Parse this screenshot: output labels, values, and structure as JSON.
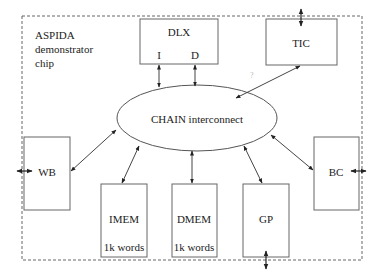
{
  "diagram": {
    "chip_label": [
      "ASPIDA",
      "demonstrator",
      "chip"
    ],
    "interconnect": {
      "label": "CHAIN interconnect"
    },
    "blocks": {
      "dlx": {
        "label": "DLX",
        "ports": {
          "instruction": "I",
          "data": "D"
        }
      },
      "tic": {
        "label": "TIC"
      },
      "wb": {
        "label": "WB"
      },
      "bc": {
        "label": "BC"
      },
      "imem": {
        "label": "IMEM",
        "size": "1k words"
      },
      "dmem": {
        "label": "DMEM",
        "size": "1k words"
      },
      "gp": {
        "label": "GP"
      }
    },
    "stray_mark": "?",
    "colors": {
      "line": "#555555",
      "text": "#222222",
      "border_dashed": "#666666"
    }
  }
}
